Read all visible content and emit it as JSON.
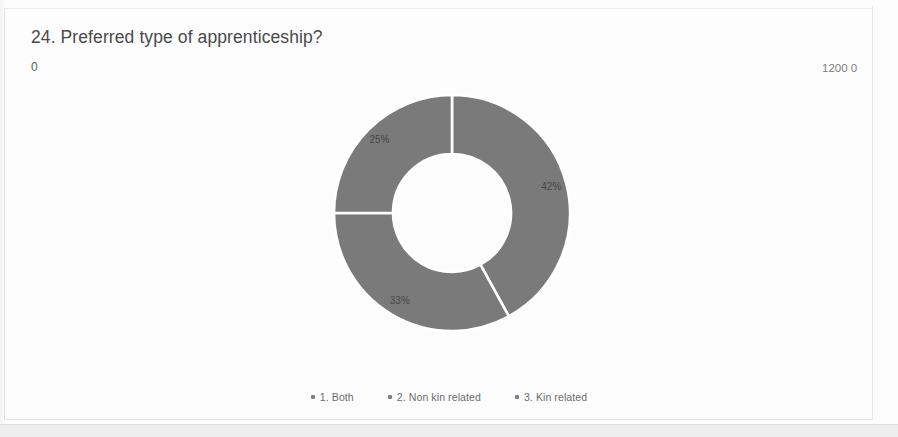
{
  "header": {
    "title": "24. Preferred type of apprenticeship?",
    "axis_min": "0",
    "axis_max": "1200 0"
  },
  "chart_data": {
    "type": "pie",
    "variant": "donut",
    "title": "24. Preferred type of apprenticeship?",
    "labels": [
      "1. Both",
      "2. Non kin related",
      "3. Kin related"
    ],
    "values": [
      42,
      33,
      25
    ],
    "data_labels": [
      "42%",
      "33%",
      "25%"
    ],
    "units": "percent",
    "total": 100,
    "start_angle_deg": 0,
    "direction": "clockwise",
    "inner_radius_ratio": 0.5,
    "colors": [
      "#7a7a7a",
      "#7a7a7a",
      "#7a7a7a"
    ],
    "separator_color": "#ffffff",
    "legend_position": "bottom",
    "axis_range_labels": [
      "0",
      "1200 0"
    ],
    "slices": [
      {
        "label": "1. Both",
        "data_label": "42%",
        "value": 42,
        "start_deg": 0,
        "end_deg": 151.2,
        "color": "#7a7a7a"
      },
      {
        "label": "2. Non kin related",
        "data_label": "33%",
        "value": 33,
        "start_deg": 151.2,
        "end_deg": 270.0,
        "color": "#7a7a7a"
      },
      {
        "label": "3. Kin related",
        "data_label": "25%",
        "value": 25,
        "start_deg": 270.0,
        "end_deg": 360.0,
        "color": "#7a7a7a"
      }
    ]
  },
  "legend": {
    "items": [
      {
        "label": "1. Both",
        "color": "#808080"
      },
      {
        "label": "2. Non kin related",
        "color": "#808080"
      },
      {
        "label": "3. Kin related",
        "color": "#808080"
      }
    ]
  }
}
